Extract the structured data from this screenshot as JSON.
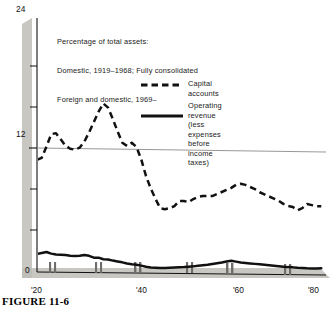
{
  "figure": {
    "caption": "FIGURE 11-6"
  },
  "note": {
    "line1": "Percentage of total assets:",
    "line2": "Domestic, 1919–1968; Fully consolidated",
    "line3": "Foreign and domestic, 1969–"
  },
  "legend": {
    "position": "inside-top-right",
    "entries": [
      {
        "name": "capital-accounts",
        "label": "Capital accounts",
        "style": "dashed",
        "color": "#111111"
      },
      {
        "name": "operating-revenue",
        "label": "Operating revenue",
        "sublabel1": "(less expenses before",
        "sublabel2": "income taxes)",
        "style": "solid",
        "color": "#111111"
      }
    ]
  },
  "colors": {
    "ink": "#111111",
    "shadow": "#c9c7c2",
    "gridline": "#8e8c88",
    "background": "#ffffff"
  },
  "chart_data": {
    "type": "line",
    "title": "Percentage of total assets: Domestic, 1919–1968; Fully consolidated Foreign and domestic, 1969–",
    "xlabel": "",
    "ylabel": "",
    "xlim": [
      1919,
      1980
    ],
    "ylim": [
      0,
      24
    ],
    "yticks": [
      0,
      12,
      24
    ],
    "yticks_minor": [
      4,
      8,
      16,
      20
    ],
    "xticks": [
      1920,
      1940,
      1960,
      1980
    ],
    "xtick_labels": [
      "'20",
      "'40",
      "'60",
      "'80"
    ],
    "grid": "single horizontal reference line at y = 12",
    "gridline_value": 12,
    "series": [
      {
        "name": "Capital accounts",
        "style": "dashed",
        "x": [
          1919,
          1920,
          1921,
          1922,
          1923,
          1924,
          1925,
          1926,
          1927,
          1928,
          1929,
          1930,
          1931,
          1932,
          1933,
          1934,
          1935,
          1936,
          1937,
          1938,
          1939,
          1940,
          1941,
          1942,
          1943,
          1944,
          1945,
          1946,
          1947,
          1948,
          1949,
          1950,
          1951,
          1952,
          1953,
          1954,
          1955,
          1956,
          1957,
          1958,
          1959,
          1960,
          1961,
          1962,
          1963,
          1964,
          1965,
          1966,
          1967,
          1968,
          1969,
          1970,
          1971,
          1972,
          1973,
          1974,
          1975,
          1976,
          1977,
          1978,
          1979
        ],
        "values": [
          10.9,
          11.1,
          12.2,
          13.4,
          13.5,
          12.9,
          12.3,
          12.0,
          11.9,
          12.1,
          12.7,
          13.6,
          14.6,
          15.6,
          16.4,
          16.0,
          14.9,
          13.7,
          12.6,
          12.3,
          12.6,
          12.2,
          11.0,
          9.4,
          8.2,
          7.2,
          6.3,
          6.2,
          6.3,
          6.5,
          7.0,
          7.0,
          6.9,
          7.2,
          7.4,
          7.5,
          7.5,
          7.5,
          7.7,
          7.9,
          8.1,
          8.3,
          8.6,
          8.7,
          8.6,
          8.4,
          8.2,
          7.9,
          7.7,
          7.5,
          7.3,
          7.1,
          6.8,
          6.6,
          6.5,
          6.2,
          6.4,
          6.8,
          6.7,
          6.6,
          6.6
        ]
      },
      {
        "name": "Operating revenue (less expenses before income taxes)",
        "style": "solid",
        "x": [
          1919,
          1920,
          1921,
          1922,
          1923,
          1924,
          1925,
          1926,
          1927,
          1928,
          1929,
          1930,
          1931,
          1932,
          1933,
          1934,
          1935,
          1936,
          1937,
          1938,
          1939,
          1940,
          1941,
          1942,
          1943,
          1944,
          1945,
          1946,
          1947,
          1948,
          1949,
          1950,
          1951,
          1952,
          1953,
          1954,
          1955,
          1956,
          1957,
          1958,
          1959,
          1960,
          1961,
          1962,
          1963,
          1964,
          1965,
          1966,
          1967,
          1968,
          1969,
          1970,
          1971,
          1972,
          1973,
          1974,
          1975,
          1976,
          1977,
          1978,
          1979
        ],
        "values": [
          1.75,
          1.85,
          1.95,
          1.8,
          1.72,
          1.7,
          1.68,
          1.62,
          1.58,
          1.62,
          1.7,
          1.62,
          1.45,
          1.45,
          1.3,
          1.28,
          1.18,
          1.1,
          1.02,
          0.92,
          0.85,
          0.8,
          0.72,
          0.62,
          0.55,
          0.52,
          0.5,
          0.52,
          0.55,
          0.58,
          0.6,
          0.62,
          0.66,
          0.7,
          0.76,
          0.82,
          0.88,
          0.95,
          1.02,
          1.1,
          1.2,
          1.28,
          1.2,
          1.12,
          1.08,
          1.04,
          1.0,
          0.96,
          0.92,
          0.88,
          0.84,
          0.8,
          0.76,
          0.72,
          0.7,
          0.66,
          0.64,
          0.62,
          0.62,
          0.62,
          0.64
        ]
      }
    ],
    "recession_bands": [
      {
        "start": 1920.0,
        "end": 1921.2
      },
      {
        "start": 1929.5,
        "end": 1930.8
      },
      {
        "start": 1937.8,
        "end": 1939.2
      },
      {
        "start": 1948.8,
        "end": 1949.8
      },
      {
        "start": 1957.3,
        "end": 1958.4
      },
      {
        "start": 1969.6,
        "end": 1970.7
      }
    ]
  }
}
